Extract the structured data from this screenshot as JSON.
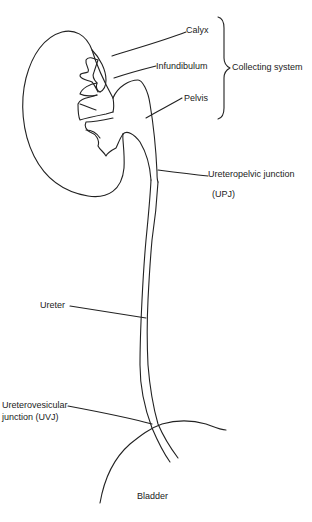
{
  "diagram": {
    "type": "anatomical line drawing",
    "labels": {
      "calyx": "Calyx",
      "infundibulum": "Infundibulum",
      "pelvis": "Pelvis",
      "collecting_system": "Collecting system",
      "upj_line1": "Ureteropelvic junction",
      "upj_line2": "(UPJ)",
      "ureter": "Ureter",
      "uvj_line1": "Ureterovesicular",
      "uvj_line2": "junction (UVJ)",
      "bladder": "Bladder"
    },
    "colors": {
      "stroke": "#222222",
      "text": "#222222",
      "background": "#ffffff"
    }
  }
}
